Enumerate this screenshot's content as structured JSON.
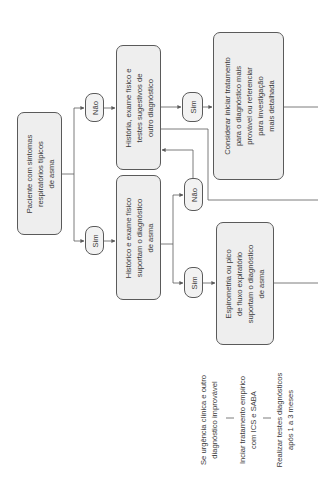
{
  "diagram": {
    "orientation": "rotated-90-ccw",
    "start_box": {
      "lines": [
        "Paciente com sintomas",
        "respiratórios típicos",
        "de asma"
      ]
    },
    "branch_no_label": "Não",
    "branch_yes_label": "Sim",
    "other_diag_box": {
      "lines": [
        "História, exame físico e",
        "testes sugestivos de",
        "outro diagnóstico"
      ]
    },
    "history_box": {
      "lines": [
        "Histórico e exame físico",
        "suportam o diagnóstico",
        "de asma"
      ]
    },
    "other_yes_label": "Sim",
    "history_no_label": "Não",
    "history_yes_label": "Sim",
    "consider_box": {
      "lines": [
        "Considerar iniciar tratamento",
        "para o diagnóstico mais",
        "provável ou referenciar",
        "para investigação",
        "mais detalhada"
      ]
    },
    "spirometry_box": {
      "lines": [
        "Espirometria ou pico",
        "de fluxo expiratório",
        "suportam o diagnóstico",
        "de asma"
      ]
    },
    "urgent_path": {
      "step1": [
        "Se urgência clínica e outro",
        "diagnóstico improvável"
      ],
      "step2": [
        "Inciar tratamento empírico",
        "com ICS e SABA"
      ],
      "step3": [
        "Realizar testes diagnósticos",
        "após 1 a 3 meses"
      ]
    },
    "colors": {
      "box_fill": "#eeeeee",
      "border": "#5a5a5a",
      "text": "#3a3a3a",
      "line": "#5a5a5a"
    }
  }
}
